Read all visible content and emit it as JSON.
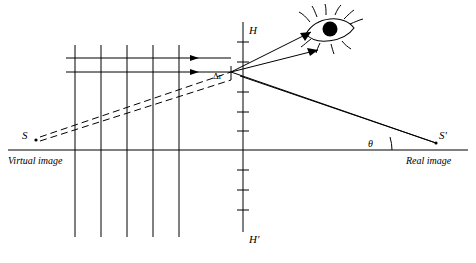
{
  "figure": {
    "labels": {
      "h_top": "H",
      "h_bottom": "H'",
      "source": "S",
      "image": "S'",
      "virtual_image": "Virtual image",
      "real_image": "Real image",
      "delta_r": "Δr",
      "theta": "θ"
    },
    "colors": {
      "ink": "#000000",
      "background": "#ffffff"
    },
    "geometry": {
      "axis_y": 150,
      "axis_x_start": 8,
      "axis_x_end": 468,
      "vertical_line_x": 243,
      "vertical_line_top": 22,
      "vertical_line_bottom": 232,
      "wavefront_lines_x": [
        75,
        101,
        127,
        153,
        179
      ],
      "wavefront_top": 45,
      "wavefront_bottom": 237,
      "ray_y_upper": 58,
      "ray_y_lower": 72,
      "vertex_x": 231,
      "vertex_y": 72,
      "source_point": [
        33,
        140
      ],
      "image_point": [
        436,
        143
      ],
      "eye_center": [
        330,
        30
      ]
    },
    "elements": {
      "horizontal_axis": "optical axis",
      "vertical_axis": "principal plane HH'",
      "incoming_rays": 2,
      "wavefronts": 5,
      "dashed_rays": 2,
      "eye_icon": "eye-icon"
    }
  }
}
